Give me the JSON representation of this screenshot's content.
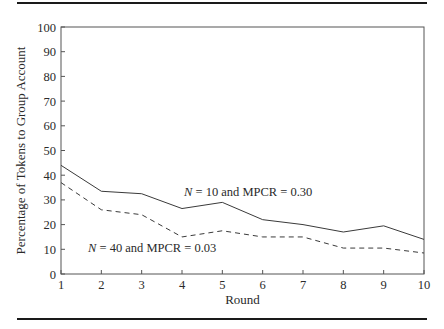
{
  "chart_data": {
    "type": "line",
    "title": "",
    "xlabel": "Round",
    "ylabel": "Percentage of Tokens to Group Account",
    "x": [
      1,
      2,
      3,
      4,
      5,
      6,
      7,
      8,
      9,
      10
    ],
    "xlim": [
      1,
      10
    ],
    "ylim": [
      0,
      100
    ],
    "x_ticks": [
      "1",
      "2",
      "3",
      "4",
      "5",
      "6",
      "7",
      "8",
      "9",
      "10"
    ],
    "y_ticks": [
      "0",
      "10",
      "20",
      "30",
      "40",
      "50",
      "60",
      "70",
      "80",
      "90",
      "100"
    ],
    "grid": false,
    "legend": "inline annotations",
    "series": [
      {
        "name": "N = 10 and MPCR = 0.30",
        "style": "solid",
        "values": [
          44,
          33.5,
          32.5,
          26.5,
          29,
          22,
          20,
          17,
          19.5,
          14
        ]
      },
      {
        "name": "N = 40 and MPCR = 0.03",
        "style": "dashed",
        "values": [
          37,
          26,
          24,
          15,
          17.5,
          15,
          15,
          10.5,
          10.5,
          8.5
        ]
      }
    ],
    "annotations": [
      {
        "text_italic": "N",
        "text_rest": " = 10 and MPCR = 0.30",
        "series": 0
      },
      {
        "text_italic": "N",
        "text_rest": " = 40 and MPCR = 0.03",
        "series": 1
      }
    ]
  },
  "colors": {
    "line": "#3a3a3a",
    "axis": "#555555",
    "rule": "#1a1a1a"
  }
}
